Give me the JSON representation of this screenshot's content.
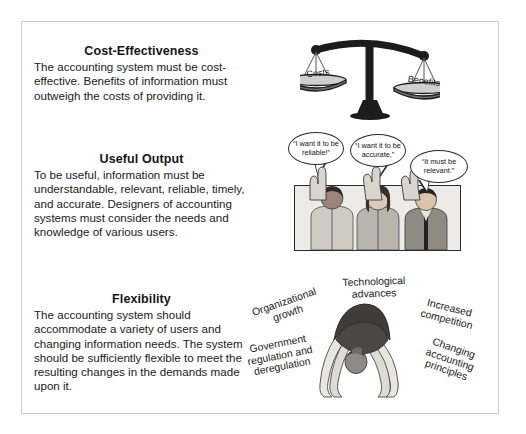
{
  "page": {
    "background_color": "#ffffff",
    "border_color": "#c9c9c9"
  },
  "sections": [
    {
      "id": "cost-effectiveness",
      "heading": "Cost-Effectiveness",
      "body": "The accounting system must be cost-effective. Benefits of information must outweigh the costs of providing it."
    },
    {
      "id": "useful-output",
      "heading": "Useful Output",
      "body": "To be useful, information must be understandable, relevant, reliable, timely, and accurate. Designers of accounting systems must consider the needs and knowledge of various users."
    },
    {
      "id": "flexibility",
      "heading": "Flexibility",
      "body": "The accounting system should accommodate a variety of users and changing information needs. The system should be sufficiently flexible to meet the resulting changes in the demands made upon it."
    }
  ],
  "scale_illustration": {
    "name": "balance-scale",
    "left_pan_label": "Costs",
    "right_pan_label": "Benefits"
  },
  "people_illustration": {
    "name": "three-people-raising-hands",
    "speech_bubbles": [
      "“I want it to be reliable!”",
      "“I want it to be accurate.”",
      "“It must be relevant.”"
    ]
  },
  "flexibility_illustration": {
    "name": "gymnast-backbend",
    "labels": [
      "Organizational\ngrowth",
      "Technological\nadvances",
      "Increased\ncompetition",
      "Government\nregulation and\nderegulation",
      "Changing\naccounting\nprinciples"
    ]
  }
}
